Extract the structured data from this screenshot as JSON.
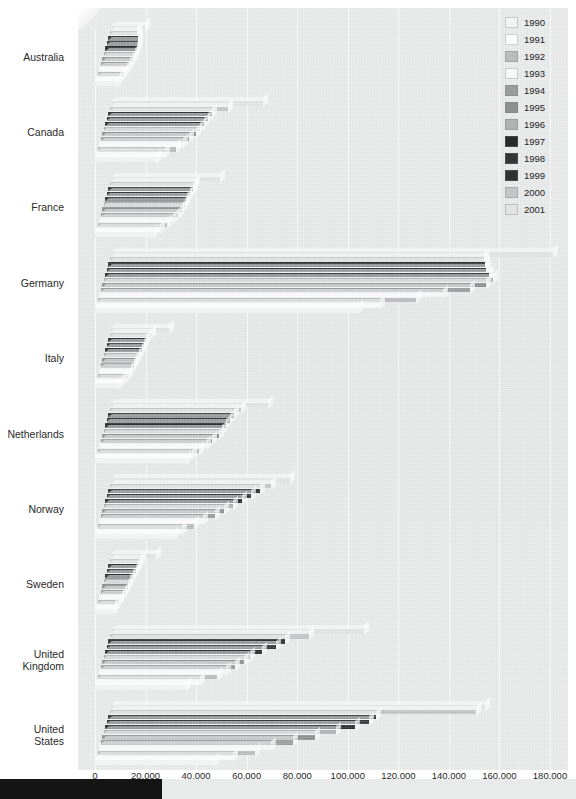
{
  "chart_data": {
    "type": "bar",
    "orientation": "horizontal",
    "title": "",
    "xlabel": "",
    "ylabel": "",
    "xlim": [
      0,
      180000
    ],
    "xticks": [
      0,
      20000,
      40000,
      60000,
      80000,
      100000,
      120000,
      140000,
      160000,
      180000
    ],
    "xtick_labels": [
      "0",
      "20,000",
      "40,000",
      "60,000",
      "80,000",
      "100,000",
      "120,000",
      "140,000",
      "160,000",
      "180,000"
    ],
    "grid": true,
    "legend_position": "top-right",
    "categories": [
      "Australia",
      "Canada",
      "France",
      "Germany",
      "Italy",
      "Netherlands",
      "Norway",
      "Sweden",
      "United Kingdom",
      "United States"
    ],
    "series": [
      {
        "name": "1990",
        "color": "#f2f3f3",
        "values": [
          8500,
          24000,
          23000,
          104000,
          9000,
          36000,
          31000,
          7000,
          36000,
          47000
        ]
      },
      {
        "name": "1991",
        "color": "#fafbfb",
        "values": [
          9500,
          27000,
          25000,
          112000,
          10500,
          38000,
          34000,
          7500,
          41000,
          54000
        ]
      },
      {
        "name": "1992",
        "color": "#b9bcbd",
        "values": [
          10500,
          31000,
          27500,
          126000,
          12000,
          40000,
          38000,
          8500,
          47000,
          62000
        ]
      },
      {
        "name": "1993",
        "color": "#f6f7f7",
        "values": [
          11000,
          33000,
          29000,
          136000,
          12500,
          42000,
          41000,
          9000,
          50000,
          68000
        ]
      },
      {
        "name": "1994",
        "color": "#9a9d9e",
        "values": [
          11500,
          35000,
          30500,
          146000,
          13000,
          44000,
          45000,
          9500,
          53000,
          76000
        ]
      },
      {
        "name": "1995",
        "color": "#8d9091",
        "values": [
          12000,
          37000,
          31500,
          152000,
          13500,
          46000,
          48000,
          10000,
          56000,
          84000
        ]
      },
      {
        "name": "1996",
        "color": "#b0b3b4",
        "values": [
          12500,
          38000,
          32000,
          154000,
          14000,
          47000,
          51000,
          10500,
          58000,
          92000
        ]
      },
      {
        "name": "1997",
        "color": "#2a2b2d",
        "values": [
          12800,
          39000,
          32500,
          152000,
          14500,
          48000,
          54000,
          11000,
          62000,
          99000
        ]
      },
      {
        "name": "1998",
        "color": "#343638",
        "values": [
          12500,
          40000,
          33000,
          150000,
          14800,
          49000,
          57000,
          11500,
          67000,
          104000
        ]
      },
      {
        "name": "1999",
        "color": "#2f3133",
        "values": [
          12000,
          41000,
          33500,
          149000,
          15000,
          50000,
          60000,
          11800,
          70000,
          106000
        ]
      },
      {
        "name": "2000",
        "color": "#c3c6c7",
        "values": [
          11000,
          47000,
          34000,
          148000,
          16500,
          52000,
          64000,
          12500,
          79000,
          145000
        ]
      },
      {
        "name": "2001",
        "color": "#e2e4e4",
        "values": [
          13500,
          60000,
          43000,
          175000,
          23000,
          62000,
          71000,
          18000,
          100000,
          148000
        ]
      }
    ]
  },
  "legend": {
    "items": [
      {
        "label": "1990"
      },
      {
        "label": "1991"
      },
      {
        "label": "1992"
      },
      {
        "label": "1993"
      },
      {
        "label": "1994"
      },
      {
        "label": "1995"
      },
      {
        "label": "1996"
      },
      {
        "label": "1997"
      },
      {
        "label": "1998"
      },
      {
        "label": "1999"
      },
      {
        "label": "2000"
      },
      {
        "label": "2001"
      }
    ]
  },
  "theme": {
    "panel_background": "#e8e9e9",
    "gridline_color": "#ffffff",
    "text_color": "#262626",
    "footer_color": "#141414"
  }
}
